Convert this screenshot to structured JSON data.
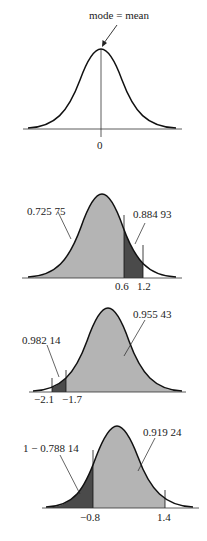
{
  "panels": [
    {
      "id": "panel-1",
      "annotation": "mode = mean",
      "tick_labels": [
        "0"
      ]
    },
    {
      "id": "panel-2",
      "area_labels": [
        "0.725 75",
        "0.884 93"
      ],
      "tick_labels": [
        "0.6",
        "1.2"
      ]
    },
    {
      "id": "panel-3",
      "area_labels": [
        "0.982 14",
        "0.955 43"
      ],
      "tick_labels": [
        "−2.1",
        "−1.7"
      ]
    },
    {
      "id": "panel-4",
      "area_labels": [
        "1 − 0.788 14",
        "0.919 24"
      ],
      "tick_labels": [
        "−0.8",
        "1.4"
      ]
    }
  ],
  "colors": {
    "light_fill": "#b4b4b4",
    "dark_fill": "#4a4a4a",
    "stroke": "#111111"
  }
}
